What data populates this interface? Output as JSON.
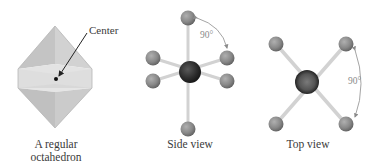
{
  "figure": {
    "panels": [
      {
        "id": "octahedron",
        "caption_line1": "A regular",
        "caption_line2": "octahedron",
        "annotation": "Center"
      },
      {
        "id": "side-view",
        "caption": "Side view",
        "angle_label": "90°"
      },
      {
        "id": "top-view",
        "caption": "Top view",
        "angle_label": "90°"
      }
    ],
    "colors": {
      "octahedron_fill": "#c8c8c8",
      "octahedron_band": "#dcdcdc",
      "central_atom": "#2e2e2e",
      "ligand_atom": "#8c8c8c",
      "bond": "#d0d0d0",
      "arrow": "#8a8a8a",
      "text": "#3a3a3a"
    }
  }
}
